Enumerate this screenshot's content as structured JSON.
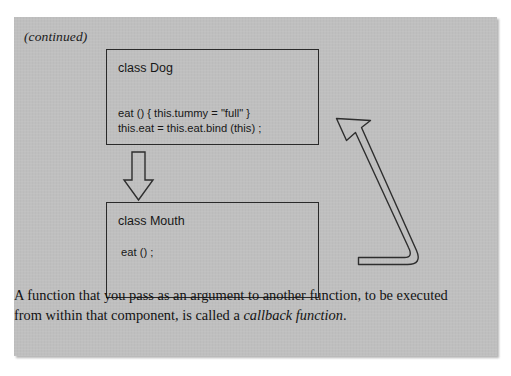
{
  "figure": {
    "continued_label": "(continued)",
    "background_color": "#bfbfbf",
    "line_color": "#2e2e2e",
    "text_color": "#171717"
  },
  "diagram": {
    "type": "class-relationship-diagram",
    "boxes": [
      {
        "id": "dog",
        "title": "class Dog",
        "code": "eat () { this.tummy = \"full\" }\nthis.eat = this.eat.bind (this) ;"
      },
      {
        "id": "mouth",
        "title": "class Mouth",
        "code": "eat () ;"
      }
    ],
    "arrows": [
      {
        "id": "dog-to-mouth",
        "style": "hollow-block-arrow",
        "direction": "down",
        "from": "dog",
        "to": "mouth"
      },
      {
        "id": "mouth-callback-to-dog",
        "style": "hollow-bent-arrow",
        "direction": "up-left",
        "from": "mouth",
        "to": "dog"
      }
    ]
  },
  "caption": {
    "text_before_emphasis": "A function that you pass as an argument to another function, to be executed from within that component, is called a ",
    "emphasis": "callback function",
    "text_after_emphasis": "."
  }
}
